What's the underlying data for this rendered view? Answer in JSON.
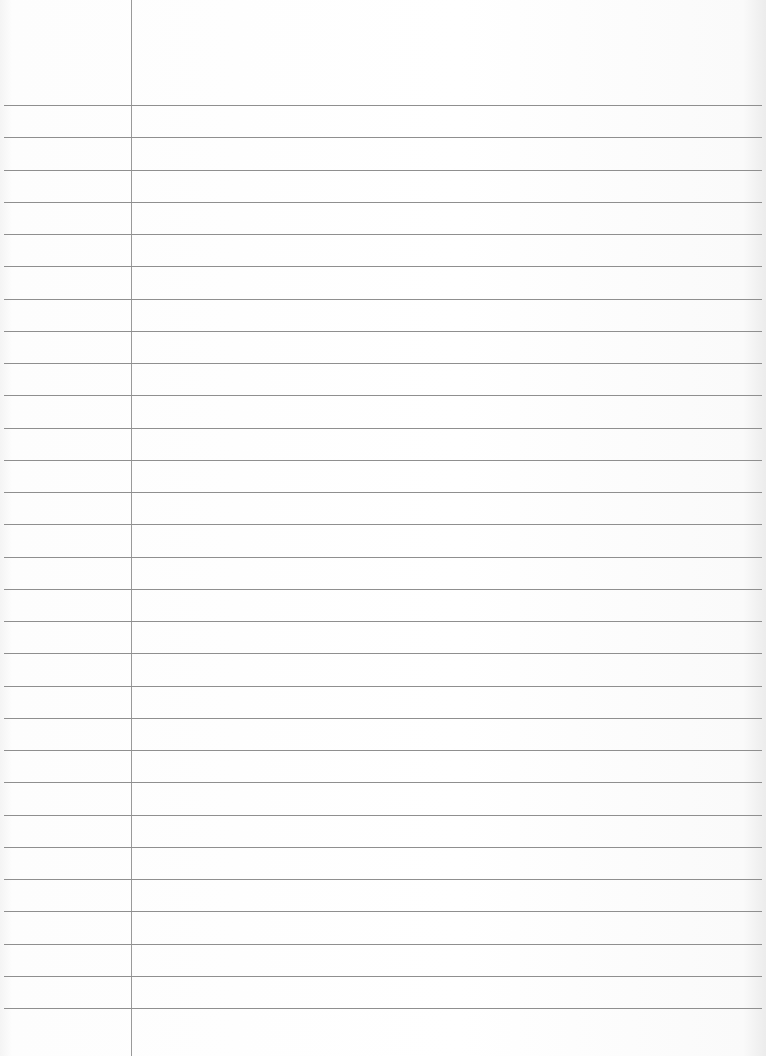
{
  "paper": {
    "type": "lined-paper",
    "background_color": "#ffffff",
    "line_color": "#8f8f8f",
    "margin_line_color": "#9a9a9a",
    "margin_line_x": 131,
    "first_line_y": 105,
    "line_spacing": 32.25,
    "line_count": 29
  }
}
